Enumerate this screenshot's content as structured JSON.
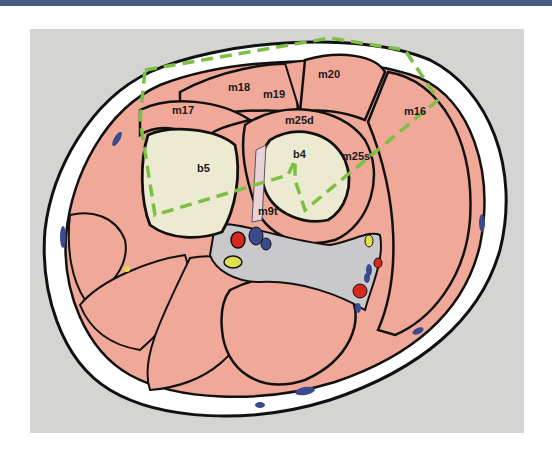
{
  "figure": {
    "colors": {
      "header": "#44607e",
      "panel_background": "#d4d4d2",
      "muscle": "#f0a898",
      "bone": "#ecebd2",
      "skin": "#ffffff",
      "outline": "#111111",
      "dashed_line": "#7cbf45",
      "artery": "#d8281c",
      "vein": "#3b4a8c",
      "nerve": "#e0df50"
    },
    "labels": {
      "m16": "m16",
      "m17": "m17",
      "m18": "m18",
      "m19": "m19",
      "m20": "m20",
      "m25d": "m25d",
      "m25s": "m25s",
      "m9t": "m9t",
      "b4": "b4",
      "b5": "b5"
    }
  }
}
